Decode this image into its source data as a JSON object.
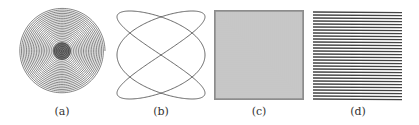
{
  "figure": {
    "panels": [
      {
        "id": "a",
        "caption": "(a)",
        "description": "concentric spiral circle with dark center"
      },
      {
        "id": "b",
        "caption": "(b)",
        "description": "Lissajous curve figure"
      },
      {
        "id": "c",
        "caption": "(c)",
        "description": "dense checkered square lattice"
      },
      {
        "id": "d",
        "caption": "(d)",
        "description": "horizontal line pattern"
      }
    ]
  }
}
